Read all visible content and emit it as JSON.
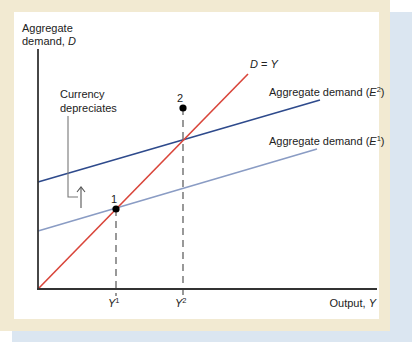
{
  "axes": {
    "y_label_line1": "Aggregate",
    "y_label_line2": "demand, ",
    "y_label_var": "D",
    "x_label": "Output, ",
    "x_label_var": "Y"
  },
  "lines": {
    "identity": {
      "label_lhs": "D",
      "label_eq": " = ",
      "label_rhs": "Y",
      "color": "#d9453a"
    },
    "e2": {
      "label": "Aggregate demand (",
      "label_var": "E",
      "label_sup": "2",
      "label_close": ")",
      "color": "#2e4a8c"
    },
    "e1": {
      "label": "Aggregate demand (",
      "label_var": "E",
      "label_sup": "1",
      "label_close": ")",
      "color": "#8a9cc4"
    }
  },
  "annotation": {
    "line1": "Currency",
    "line2": "depreciates"
  },
  "points": [
    {
      "label": "1"
    },
    {
      "label": "2"
    }
  ],
  "ticks": [
    {
      "var": "Y",
      "sup": "1"
    },
    {
      "var": "Y",
      "sup": "2"
    }
  ],
  "colors": {
    "frame": "#f2ead2",
    "shadow": "#dbe6f1",
    "axis": "#333333",
    "dash": "#555555",
    "leader": "#777777"
  }
}
